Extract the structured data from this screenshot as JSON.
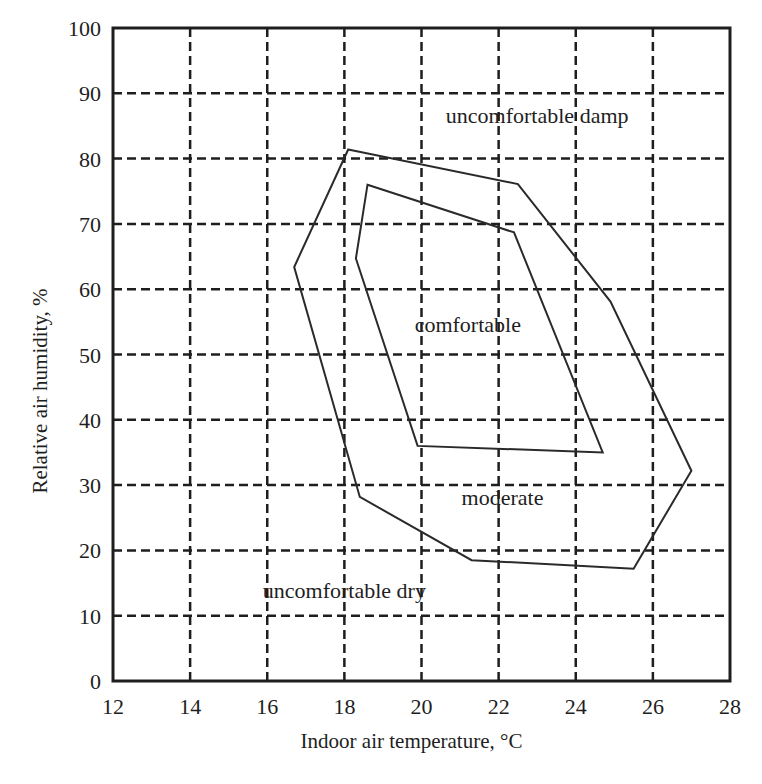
{
  "chart_data": {
    "type": "area",
    "title": "",
    "xlabel": "Indoor air temperature, °C",
    "ylabel": "Relative air humidity, %",
    "xlim": [
      12,
      28
    ],
    "ylim": [
      0,
      100
    ],
    "x_ticks": [
      12,
      14,
      16,
      18,
      20,
      22,
      24,
      26,
      28
    ],
    "y_ticks": [
      0,
      10,
      20,
      30,
      40,
      50,
      60,
      70,
      80,
      90,
      100
    ],
    "grid": true,
    "grid_style": "dashed",
    "legend": null,
    "series": [
      {
        "name": "moderate zone boundary (outer polygon)",
        "type": "polygon",
        "points": [
          {
            "x": 18.1,
            "y": 81.4
          },
          {
            "x": 22.5,
            "y": 76.1
          },
          {
            "x": 24.9,
            "y": 58.1
          },
          {
            "x": 27.0,
            "y": 32.2
          },
          {
            "x": 25.5,
            "y": 17.2
          },
          {
            "x": 21.3,
            "y": 18.5
          },
          {
            "x": 18.4,
            "y": 28.2
          },
          {
            "x": 16.7,
            "y": 63.4
          }
        ]
      },
      {
        "name": "comfortable zone boundary (inner polygon)",
        "type": "polygon",
        "points": [
          {
            "x": 18.6,
            "y": 76.0
          },
          {
            "x": 22.4,
            "y": 68.7
          },
          {
            "x": 24.7,
            "y": 35.0
          },
          {
            "x": 19.9,
            "y": 36.0
          },
          {
            "x": 18.3,
            "y": 64.7
          }
        ]
      }
    ],
    "annotations": [
      {
        "text": "uncomfortable damp",
        "x": 23.0,
        "y": 86.5
      },
      {
        "text": "comfortable",
        "x": 21.2,
        "y": 54.5
      },
      {
        "text": "moderate",
        "x": 22.1,
        "y": 28.0
      },
      {
        "text": "uncomfortable dry",
        "x": 18.0,
        "y": 13.8
      }
    ],
    "colors": {
      "line": "#2a2a2a",
      "grid": "#1e1e1e",
      "background": "#ffffff"
    }
  }
}
